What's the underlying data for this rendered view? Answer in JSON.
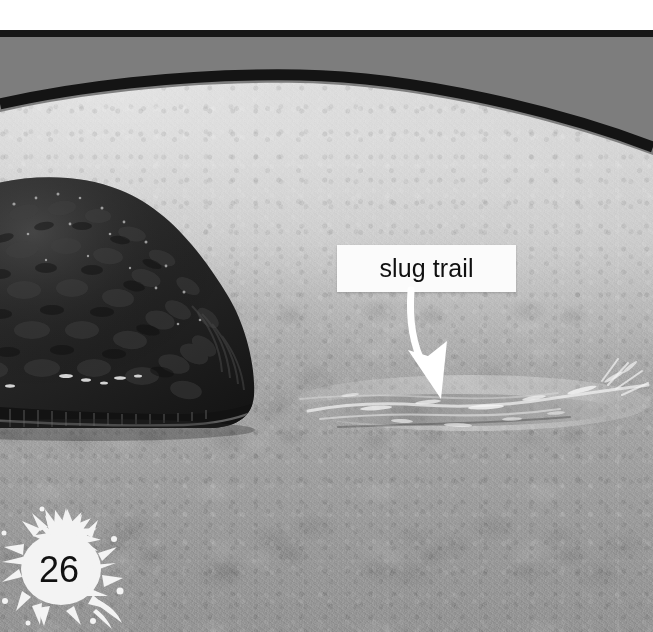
{
  "page": {
    "width": 653,
    "height": 632,
    "page_number": "26",
    "background_color": "#ffffff"
  },
  "header": {
    "rule_color": "#181818",
    "band_color": "#7d7d7d",
    "arc_color": "#141414"
  },
  "photo": {
    "subject": "slug-on-sand",
    "description": "A dark textured slug at left with a glistening slime trail across damp sand",
    "slug_color": "#2a2a2a",
    "sand_color": "#b4b4b4",
    "trail_highlight_color": "#e8e8e8"
  },
  "callout": {
    "label": "slug trail",
    "box_color": "#fbfbfb",
    "text_color": "#101010",
    "arrow_color": "#ffffff",
    "arrow_name": "curved-down-arrow"
  },
  "page_badge": {
    "number": "26",
    "shape": "splat",
    "fill_color": "#f4f4f4",
    "text_color": "#111111"
  }
}
